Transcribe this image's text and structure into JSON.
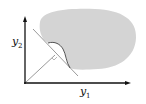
{
  "diagram": {
    "axes": {
      "x_label": "y",
      "x_label_sub": "1",
      "y_label": "y",
      "y_label_sub": "2"
    },
    "colors": {
      "region_fill": "#d4d4d4",
      "axis": "#111111",
      "line": "#9a9a9a",
      "curve": "#555555"
    },
    "elements": [
      "feasible-region-blob",
      "supporting-hyperplane-line",
      "normal-vector-line",
      "boundary-curve",
      "right-angle-mark"
    ]
  }
}
